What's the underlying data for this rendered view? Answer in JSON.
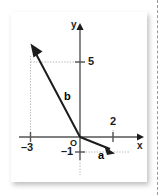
{
  "figure": {
    "type": "vector-diagram",
    "title": "",
    "axes": {
      "x_label": "x",
      "y_label": "y",
      "origin_label": "O",
      "x_range": [
        -4,
        3
      ],
      "y_range": [
        -2,
        6
      ],
      "grid": false
    },
    "ticks": [
      {
        "name": "x-tick-neg3",
        "axis": "x",
        "value": -3,
        "label": "–3"
      },
      {
        "name": "x-tick-2",
        "axis": "x",
        "value": 2,
        "label": "2"
      },
      {
        "name": "y-tick-5",
        "axis": "y",
        "value": 5,
        "label": "5"
      },
      {
        "name": "y-tick-neg1",
        "axis": "y",
        "value": -1,
        "label": "–1"
      }
    ],
    "vectors": [
      {
        "name": "vector-a",
        "label": "a",
        "from": [
          0,
          0
        ],
        "to": [
          2,
          -1
        ],
        "components": {
          "x": 2,
          "y": -1
        },
        "color": "#1c1c1c"
      },
      {
        "name": "vector-b",
        "label": "b",
        "from": [
          0,
          0
        ],
        "to": [
          -3,
          5
        ],
        "components": {
          "x": -3,
          "y": 5
        },
        "color": "#1c1c1c"
      }
    ],
    "guide_lines": [
      {
        "name": "guide-b-horizontal",
        "from": [
          -3,
          5
        ],
        "to": [
          0,
          5
        ]
      },
      {
        "name": "guide-b-vertical",
        "from": [
          -3,
          5
        ],
        "to": [
          -3,
          0
        ]
      },
      {
        "name": "guide-a-horizontal",
        "from": [
          0,
          -1
        ],
        "to": [
          2,
          -1
        ]
      },
      {
        "name": "guide-a-vertical",
        "from": [
          2,
          -1
        ],
        "to": [
          2,
          0
        ]
      }
    ],
    "colors": {
      "stroke": "#1c1c1c",
      "axis": "#555555",
      "guide": "#b8b8b8",
      "card": "#ffffff",
      "page_cut": "#9a9a9a"
    }
  }
}
